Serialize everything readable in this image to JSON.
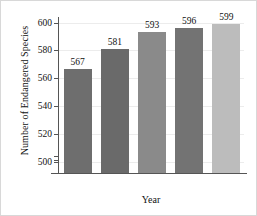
{
  "chart_data": {
    "type": "bar",
    "title": "",
    "xlabel": "Year",
    "ylabel": "Number of Endangered Species",
    "categories": [
      "1998",
      "1999",
      "2000",
      "2001",
      "2003"
    ],
    "values": [
      567,
      581,
      593,
      596,
      599
    ],
    "value_labels": [
      "567",
      "581",
      "593",
      "596",
      "599"
    ],
    "series": [
      {
        "name": "Number of Endangered Species",
        "values": [
          567,
          581,
          593,
          596,
          599
        ]
      }
    ],
    "bar_colors": [
      "#6e6e6e",
      "#6a6a6a",
      "#8a8a8a",
      "#737373",
      "#bcbcbc"
    ],
    "ylim": [
      492,
      604
    ],
    "yticks": [
      500,
      520,
      540,
      560,
      580,
      600
    ],
    "ytick_labels": [
      "500",
      "520",
      "540",
      "560",
      "580",
      "600"
    ],
    "grid": true,
    "grid_color": "#ececec",
    "axis_color": "#555555",
    "legend": "none",
    "axis_break": true
  }
}
